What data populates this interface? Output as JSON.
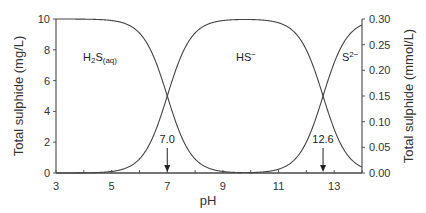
{
  "chart_data": {
    "type": "line",
    "title": "",
    "xlabel": "pH",
    "ylabel": "Total sulphide (mg/L)",
    "y2label": "Total sulphide (mmol/L)",
    "xlim": [
      3,
      14
    ],
    "ylim": [
      0,
      10
    ],
    "y2lim": [
      0,
      0.3
    ],
    "x_ticks": [
      3,
      5,
      7,
      9,
      11,
      13
    ],
    "y_ticks": [
      0,
      2,
      4,
      6,
      8,
      10
    ],
    "y2_ticks": [
      "0.00",
      "0.05",
      "0.10",
      "0.15",
      "0.20",
      "0.25",
      "0.30"
    ],
    "grid": false,
    "pKa1": 7.0,
    "pKa2": 12.6,
    "series": [
      {
        "name": "H2S(aq)",
        "x": [
          3,
          4,
          5,
          6,
          6.5,
          7,
          7.5,
          8,
          9,
          10,
          11,
          12,
          13,
          14
        ],
        "values": [
          10,
          9.99,
          9.9,
          9.09,
          7.6,
          5.0,
          2.4,
          0.91,
          0.1,
          0.01,
          0,
          0,
          0,
          0
        ]
      },
      {
        "name": "HS-",
        "x": [
          3,
          4,
          5,
          6,
          6.5,
          7,
          7.5,
          8,
          9,
          10,
          11,
          12,
          13,
          14
        ],
        "values": [
          0,
          0.01,
          0.1,
          0.91,
          2.4,
          5.0,
          7.6,
          9.08,
          9.87,
          9.96,
          9.87,
          7.99,
          2.85,
          0.24
        ]
      },
      {
        "name": "S2-",
        "x": [
          3,
          4,
          5,
          6,
          7,
          8,
          9,
          10,
          11,
          12,
          12.6,
          13,
          14
        ],
        "values": [
          0,
          0,
          0,
          0,
          0,
          0,
          0,
          0.02,
          0.25,
          2.0,
          5.0,
          7.15,
          9.76
        ]
      }
    ],
    "annotations": [
      {
        "text": "7.0",
        "x": 7.0,
        "type": "arrow-down"
      },
      {
        "text": "12.6",
        "x": 12.6,
        "type": "arrow-down"
      }
    ]
  },
  "labels": {
    "h2s_main": "H",
    "h2s_sub2": "2",
    "h2s_s": "S",
    "h2s_aq": "(aq)",
    "hs_main": "HS",
    "hs_sup": "−",
    "s2_main": "S",
    "s2_sup": "2−"
  }
}
